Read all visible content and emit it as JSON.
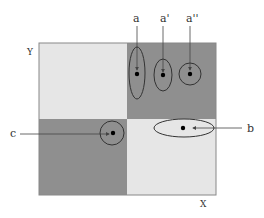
{
  "diagram": {
    "axes": {
      "x_label": "X",
      "y_label": "Y"
    },
    "quadrants": [
      {
        "name": "top-left",
        "shade": "light",
        "color": "#e6e6e6"
      },
      {
        "name": "top-right",
        "shade": "dark",
        "color": "#8f8f8f"
      },
      {
        "name": "bottom-left",
        "shade": "dark",
        "color": "#8f8f8f"
      },
      {
        "name": "bottom-right",
        "shade": "light",
        "color": "#e6e6e6"
      }
    ],
    "points": [
      {
        "label": "a",
        "shape": "tall-ellipse",
        "quadrant": "top-right"
      },
      {
        "label": "a'",
        "shape": "ellipse",
        "quadrant": "top-right"
      },
      {
        "label": "a''",
        "shape": "circle",
        "quadrant": "top-right"
      },
      {
        "label": "c",
        "shape": "circle",
        "quadrant": "bottom-left"
      },
      {
        "label": "b",
        "shape": "wide-ellipse",
        "quadrant": "bottom-right"
      }
    ]
  }
}
